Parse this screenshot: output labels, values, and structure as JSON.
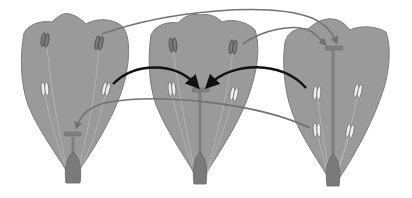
{
  "diagram": {
    "type": "tristylous-flower-pollination",
    "description_visible_text": "",
    "colors": {
      "background": "#ffffff",
      "petal_fill": "#9a9a9a",
      "petal_stroke": "#7c7c7c",
      "style": "#7f7f7f",
      "ovary": "#7a7a7a",
      "anther_dark": "#7b7b7b",
      "anther_light": "#eeeeee",
      "arrow_gray": "#727272",
      "arrow_black": "#111111"
    },
    "flowers": [
      {
        "id": "short-styled",
        "stigma_level": "low",
        "anther_levels": [
          "high",
          "mid"
        ]
      },
      {
        "id": "mid-styled",
        "stigma_level": "mid",
        "anther_levels": [
          "high",
          "low"
        ]
      },
      {
        "id": "long-styled",
        "stigma_level": "high",
        "anther_levels": [
          "mid",
          "low"
        ]
      }
    ],
    "arrows": [
      {
        "from": "flower-1 high anther",
        "to": "flower-3 stigma",
        "style": "gray"
      },
      {
        "from": "flower-2 high anther",
        "to": "flower-3 stigma",
        "style": "gray"
      },
      {
        "from": "flower-1 mid anther",
        "to": "flower-2 stigma",
        "style": "black"
      },
      {
        "from": "flower-3 mid anther",
        "to": "flower-2 stigma",
        "style": "black"
      },
      {
        "from": "flower-3 low anther",
        "to": "flower-1 stigma",
        "style": "gray"
      }
    ]
  }
}
